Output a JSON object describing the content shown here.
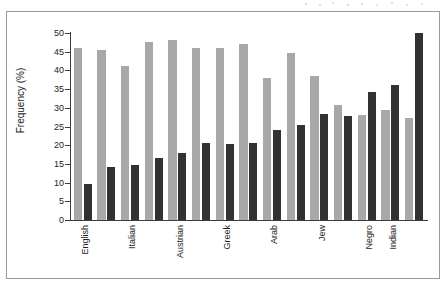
{
  "figure": {
    "has_outer_frame": true,
    "background_color": "#ffffff"
  },
  "chart_data": {
    "type": "bar",
    "title": "",
    "xlabel": "",
    "ylabel": "Frequency (%)",
    "ylim": [
      0,
      50
    ],
    "y_ticks": [
      0,
      5,
      10,
      15,
      20,
      25,
      30,
      35,
      40,
      45,
      50
    ],
    "grid": false,
    "legend": "none",
    "colors": {
      "series_a": "#a8a8a8",
      "series_b": "#323232",
      "axis": "#3b3b3b",
      "text": "#1c1c1c"
    },
    "group_count": 14,
    "categories": [
      "English",
      "",
      "Italian",
      "",
      "Austrian",
      "",
      "Greek",
      "",
      "Arab",
      "",
      "Jew",
      "",
      "Negro",
      "",
      "Indian"
    ],
    "visible_tick_labels": [
      "English",
      "Italian",
      "Austrian",
      "Greek",
      "Arab",
      "Jew",
      "Negro",
      "Indian"
    ],
    "tick_label_group_indices": [
      0,
      2,
      4,
      6,
      8,
      10,
      12,
      13
    ],
    "series": [
      {
        "name": "series-a-light",
        "color": "#a8a8a8",
        "values": [
          46.0,
          45.5,
          41.2,
          47.5,
          48.0,
          46.1,
          46.1,
          47.0,
          37.9,
          44.7,
          38.5,
          30.8,
          28.0,
          29.4,
          27.4
        ]
      },
      {
        "name": "series-b-dark",
        "color": "#323232",
        "values": [
          9.5,
          14.3,
          14.8,
          16.7,
          17.8,
          20.6,
          20.2,
          20.6,
          24.0,
          25.5,
          28.4,
          27.9,
          34.3,
          36.1,
          50.1
        ]
      }
    ]
  }
}
